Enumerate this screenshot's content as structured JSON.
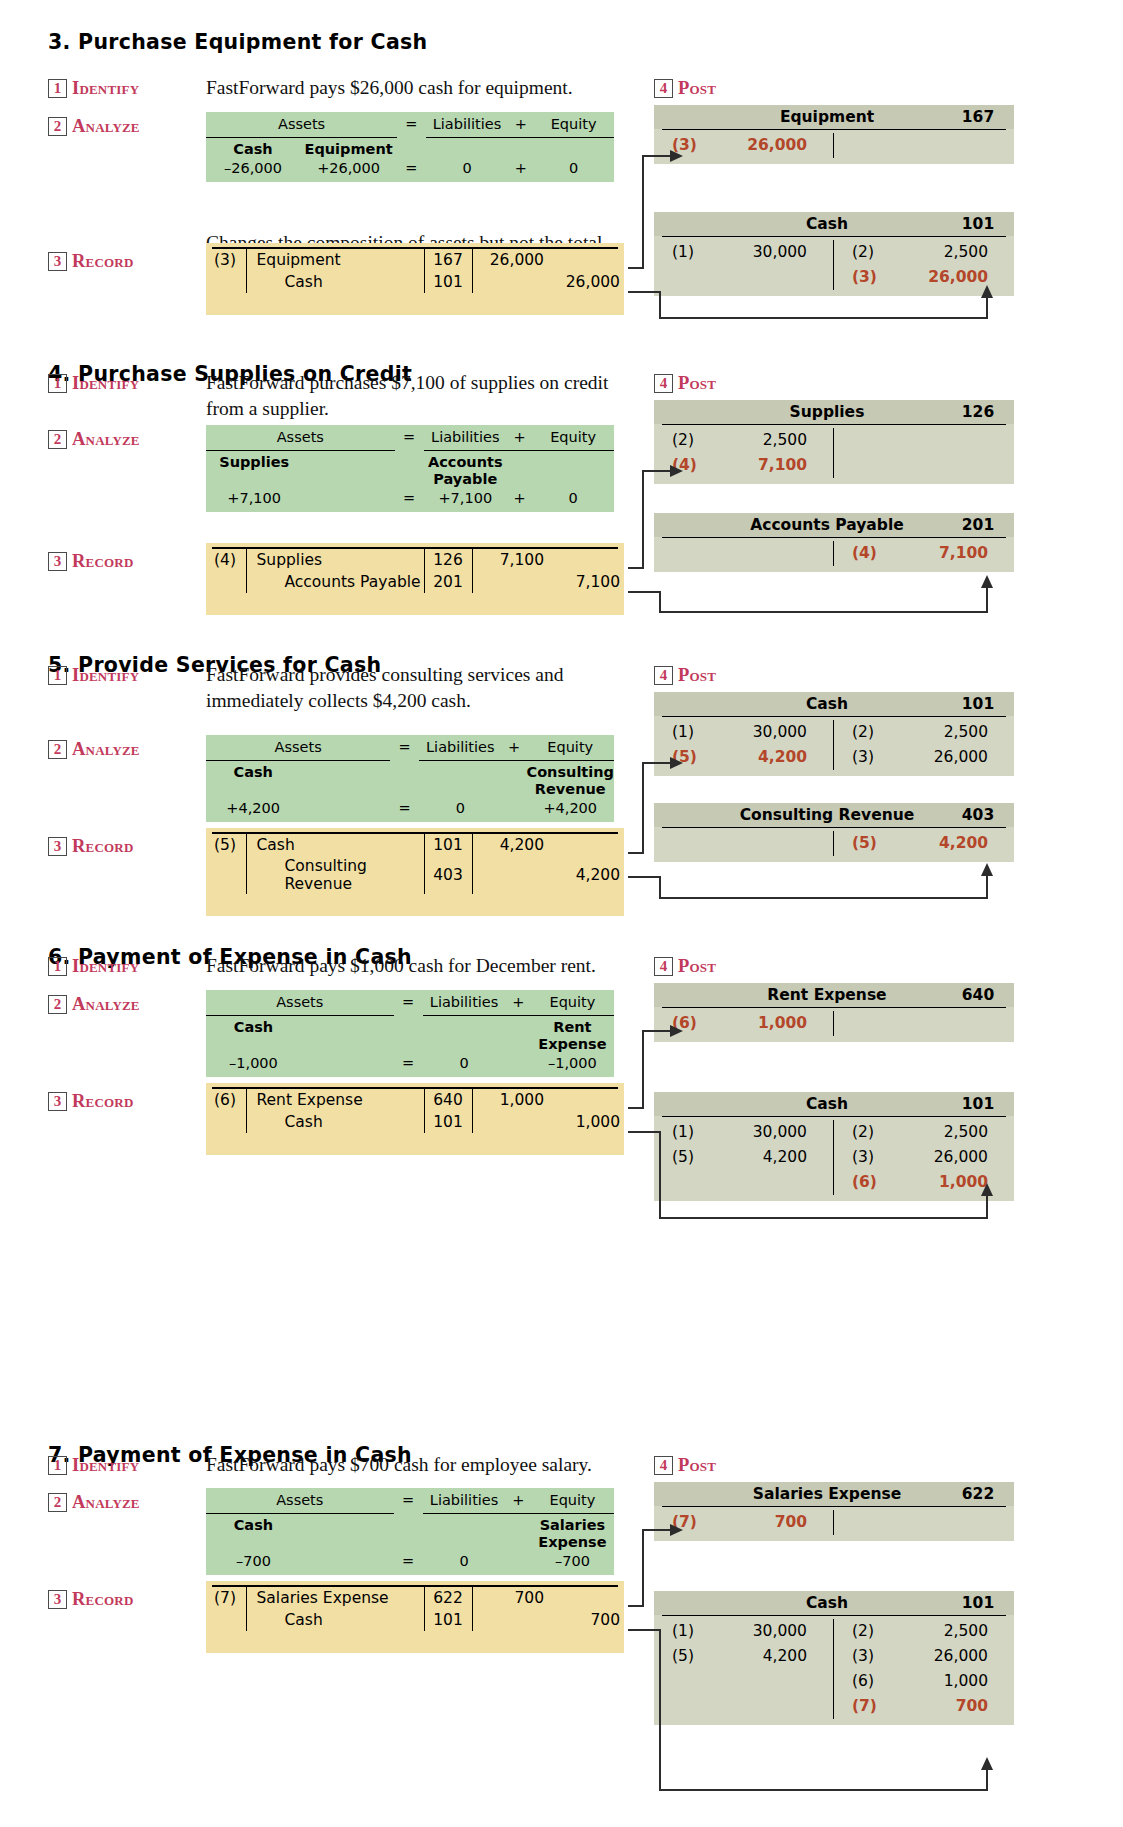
{
  "labels": {
    "identify": "Identify",
    "analyze": "Analyze",
    "record": "Record",
    "post": "Post",
    "n1": "1",
    "n2": "2",
    "n3": "3",
    "n4": "4"
  },
  "analyze_headers": {
    "assets": "Assets",
    "eq": "=",
    "liabilities": "Liabilities",
    "plus": "+",
    "equity": "Equity"
  },
  "colors": {
    "analyze_bg": "#b7d7b0",
    "record_bg": "#f2dfa4",
    "tacct_bg": "#d3d6c3",
    "tacct_hdr_bg": "#c6c9b4",
    "step_accent": "#c2395b",
    "highlight": "#b4462a"
  },
  "sections": [
    {
      "title": "3. Purchase Equipment for Cash",
      "identify": "FastForward pays $26,000 cash for equipment.",
      "note": "Changes the composition of assets but not the total.",
      "analyze": {
        "asset_names": [
          "Cash",
          "Equipment"
        ],
        "asset_names2": [
          "",
          ""
        ],
        "asset_vals": [
          "–26,000",
          "+26,000"
        ],
        "eq": "=",
        "liab_name": "",
        "liab_name2": "",
        "liab_val": "0",
        "plus": "+",
        "equity_name": "",
        "equity_name2": "",
        "equity_val": "0"
      },
      "record": {
        "ref": "(3)",
        "lines": [
          {
            "account": "Equipment",
            "num": "167",
            "debit": "26,000",
            "credit": ""
          },
          {
            "account": "Cash",
            "num": "101",
            "debit": "",
            "credit": "26,000"
          }
        ]
      },
      "post": [
        {
          "name": "Equipment",
          "number": "167",
          "debits": [
            {
              "ref": "(3)",
              "amount": "26,000",
              "highlight": true
            }
          ],
          "credits": []
        },
        {
          "name": "Cash",
          "number": "101",
          "debits": [
            {
              "ref": "(1)",
              "amount": "30,000",
              "highlight": false
            }
          ],
          "credits": [
            {
              "ref": "(2)",
              "amount": "2,500",
              "highlight": false
            },
            {
              "ref": "(3)",
              "amount": "26,000",
              "highlight": true
            }
          ]
        }
      ]
    },
    {
      "title": "4. Purchase Supplies on Credit",
      "identify": "FastForward purchases $7,100 of supplies on credit from a supplier.",
      "note": "",
      "analyze": {
        "asset_names": [
          "Supplies",
          ""
        ],
        "asset_names2": [
          "",
          ""
        ],
        "asset_vals": [
          "+7,100",
          ""
        ],
        "eq": "=",
        "liab_name": "Accounts",
        "liab_name2": "Payable",
        "liab_val": "+7,100",
        "plus": "+",
        "equity_name": "",
        "equity_name2": "",
        "equity_val": "0"
      },
      "record": {
        "ref": "(4)",
        "lines": [
          {
            "account": "Supplies",
            "num": "126",
            "debit": "7,100",
            "credit": ""
          },
          {
            "account": "Accounts Payable",
            "num": "201",
            "debit": "",
            "credit": "7,100"
          }
        ]
      },
      "post": [
        {
          "name": "Supplies",
          "number": "126",
          "debits": [
            {
              "ref": "(2)",
              "amount": "2,500",
              "highlight": false
            },
            {
              "ref": "(4)",
              "amount": "7,100",
              "highlight": true
            }
          ],
          "credits": []
        },
        {
          "name": "Accounts Payable",
          "number": "201",
          "debits": [],
          "credits": [
            {
              "ref": "(4)",
              "amount": "7,100",
              "highlight": true
            }
          ]
        }
      ]
    },
    {
      "title": "5. Provide Services for Cash",
      "identify": "FastForward provides consulting services and immediately collects $4,200 cash.",
      "note": "",
      "analyze": {
        "asset_names": [
          "Cash",
          ""
        ],
        "asset_names2": [
          "",
          ""
        ],
        "asset_vals": [
          "+4,200",
          ""
        ],
        "eq": "=",
        "liab_name": "",
        "liab_name2": "",
        "liab_val": "0",
        "plus": "",
        "equity_name": "Consulting",
        "equity_name2": "Revenue",
        "equity_val": "+4,200"
      },
      "record": {
        "ref": "(5)",
        "lines": [
          {
            "account": "Cash",
            "num": "101",
            "debit": "4,200",
            "credit": ""
          },
          {
            "account": "Consulting Revenue",
            "num": "403",
            "debit": "",
            "credit": "4,200"
          }
        ]
      },
      "post": [
        {
          "name": "Cash",
          "number": "101",
          "debits": [
            {
              "ref": "(1)",
              "amount": "30,000",
              "highlight": false
            },
            {
              "ref": "(5)",
              "amount": "4,200",
              "highlight": true
            }
          ],
          "credits": [
            {
              "ref": "(2)",
              "amount": "2,500",
              "highlight": false
            },
            {
              "ref": "(3)",
              "amount": "26,000",
              "highlight": false
            }
          ]
        },
        {
          "name": "Consulting Revenue",
          "number": "403",
          "debits": [],
          "credits": [
            {
              "ref": "(5)",
              "amount": "4,200",
              "highlight": true
            }
          ]
        }
      ]
    },
    {
      "title": "6. Payment of Expense in Cash",
      "identify": "FastForward pays $1,000 cash for December rent.",
      "note": "",
      "analyze": {
        "asset_names": [
          "Cash",
          ""
        ],
        "asset_names2": [
          "",
          ""
        ],
        "asset_vals": [
          "–1,000",
          ""
        ],
        "eq": "=",
        "liab_name": "",
        "liab_name2": "",
        "liab_val": "0",
        "plus": "",
        "equity_name": "Rent",
        "equity_name2": "Expense",
        "equity_val": "–1,000"
      },
      "record": {
        "ref": "(6)",
        "lines": [
          {
            "account": "Rent Expense",
            "num": "640",
            "debit": "1,000",
            "credit": ""
          },
          {
            "account": "Cash",
            "num": "101",
            "debit": "",
            "credit": "1,000"
          }
        ]
      },
      "post": [
        {
          "name": "Rent Expense",
          "number": "640",
          "debits": [
            {
              "ref": "(6)",
              "amount": "1,000",
              "highlight": true
            }
          ],
          "credits": []
        },
        {
          "name": "Cash",
          "number": "101",
          "debits": [
            {
              "ref": "(1)",
              "amount": "30,000",
              "highlight": false
            },
            {
              "ref": "(5)",
              "amount": "4,200",
              "highlight": false
            }
          ],
          "credits": [
            {
              "ref": "(2)",
              "amount": "2,500",
              "highlight": false
            },
            {
              "ref": "(3)",
              "amount": "26,000",
              "highlight": false
            },
            {
              "ref": "(6)",
              "amount": "1,000",
              "highlight": true
            }
          ]
        }
      ]
    },
    {
      "title": "7. Payment of Expense in Cash",
      "identify": "FastForward pays $700 cash for employee salary.",
      "note": "",
      "analyze": {
        "asset_names": [
          "Cash",
          ""
        ],
        "asset_names2": [
          "",
          ""
        ],
        "asset_vals": [
          "–700",
          ""
        ],
        "eq": "=",
        "liab_name": "",
        "liab_name2": "",
        "liab_val": "0",
        "plus": "",
        "equity_name": "Salaries",
        "equity_name2": "Expense",
        "equity_val": "–700"
      },
      "record": {
        "ref": "(7)",
        "lines": [
          {
            "account": "Salaries Expense",
            "num": "622",
            "debit": "700",
            "credit": ""
          },
          {
            "account": "Cash",
            "num": "101",
            "debit": "",
            "credit": "700"
          }
        ]
      },
      "post": [
        {
          "name": "Salaries Expense",
          "number": "622",
          "debits": [
            {
              "ref": "(7)",
              "amount": "700",
              "highlight": true
            }
          ],
          "credits": []
        },
        {
          "name": "Cash",
          "number": "101",
          "debits": [
            {
              "ref": "(1)",
              "amount": "30,000",
              "highlight": false
            },
            {
              "ref": "(5)",
              "amount": "4,200",
              "highlight": false
            }
          ],
          "credits": [
            {
              "ref": "(2)",
              "amount": "2,500",
              "highlight": false
            },
            {
              "ref": "(3)",
              "amount": "26,000",
              "highlight": false
            },
            {
              "ref": "(6)",
              "amount": "1,000",
              "highlight": false
            },
            {
              "ref": "(7)",
              "amount": "700",
              "highlight": true
            }
          ]
        }
      ]
    }
  ]
}
